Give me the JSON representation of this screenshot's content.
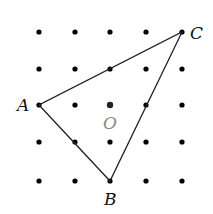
{
  "grid": {
    "xs": [
      39,
      75,
      110,
      146,
      182
    ],
    "ys": [
      32,
      69,
      105,
      142,
      181
    ],
    "dot_radius": 2.6,
    "dot_color": "#000000"
  },
  "center": {
    "x": 110,
    "y": 105,
    "label": "O",
    "color": "#555555"
  },
  "triangle": {
    "stroke": "#222222",
    "vertices": [
      {
        "name": "A",
        "x": 39,
        "y": 105,
        "label_x": 17,
        "label_y": 111
      },
      {
        "name": "B",
        "x": 110,
        "y": 181,
        "label_x": 104,
        "label_y": 205
      },
      {
        "name": "C",
        "x": 182,
        "y": 32,
        "label_x": 190,
        "label_y": 39
      }
    ]
  },
  "labels": {
    "A": "A",
    "B": "B",
    "C": "C",
    "O": "O"
  }
}
